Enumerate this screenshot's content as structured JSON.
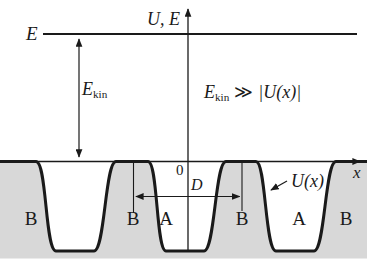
{
  "figure": {
    "axis_title": "U, E",
    "x_axis_label": "x",
    "origin_label": "0",
    "energy_line_label": "E",
    "kinetic_energy": {
      "base": "E",
      "sub": "kin"
    },
    "condition": {
      "base": "E",
      "sub": "kin",
      "relation": "≫",
      "rhs": "|U(x)|"
    },
    "period_label": "D",
    "potential_label": "U(x)",
    "regions": [
      "B",
      "B",
      "A",
      "B",
      "A",
      "B"
    ],
    "colors": {
      "shading": "#d8d8d8",
      "ink": "#1a1a1a",
      "background": "#ffffff"
    }
  }
}
